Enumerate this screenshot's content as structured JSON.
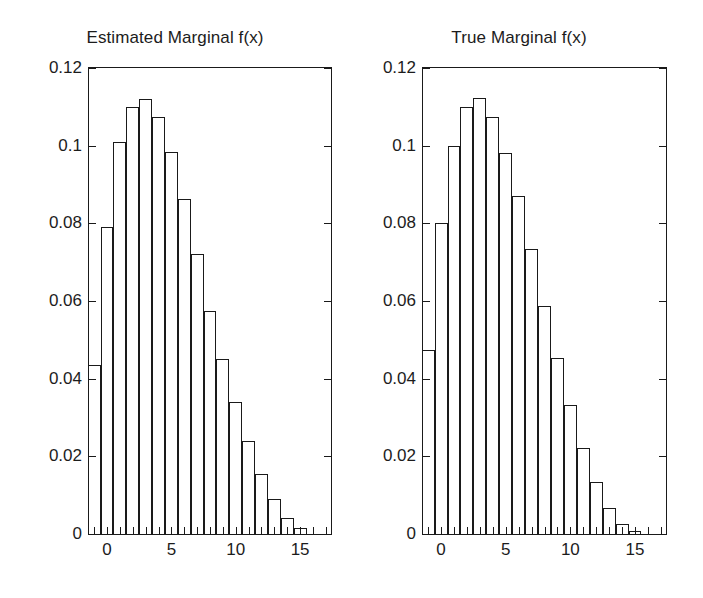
{
  "figure": {
    "background_color": "#ffffff",
    "line_color": "#1a1a1a",
    "text_color": "#1c1c1c"
  },
  "panels": [
    {
      "id": "estimated",
      "title": "Estimated Marginal f(x)"
    },
    {
      "id": "true",
      "title": "True Marginal f(x)"
    }
  ],
  "axis": {
    "y_tick_labels": [
      "0.12",
      "0.1",
      "0.08",
      "0.06",
      "0.04",
      "0.02",
      "0"
    ],
    "y_tick_values": [
      0.12,
      0.1,
      0.08,
      0.06,
      0.04,
      0.02,
      0
    ],
    "x_tick_labels": [
      "0",
      "5",
      "10",
      "15"
    ],
    "x_tick_values": [
      0,
      5,
      10,
      15
    ],
    "x_minor_step": 1,
    "ylim": [
      0,
      0.12
    ],
    "xlim": [
      -1.4,
      17.4
    ]
  },
  "chart_data": [
    {
      "type": "bar",
      "id": "estimated-marginal",
      "title": "Estimated Marginal f(x)",
      "xlabel": "",
      "ylabel": "",
      "xlim": [
        -1.4,
        17.4
      ],
      "ylim": [
        0,
        0.12
      ],
      "grid": false,
      "legend": "none",
      "bar_width": 1,
      "categories": [
        -1,
        0,
        1,
        2,
        3,
        4,
        5,
        6,
        7,
        8,
        9,
        10,
        11,
        12,
        13,
        14,
        15,
        16
      ],
      "values": [
        0.0435,
        0.079,
        0.101,
        0.11,
        0.112,
        0.1073,
        0.0985,
        0.0862,
        0.072,
        0.0575,
        0.045,
        0.034,
        0.024,
        0.0155,
        0.009,
        0.004,
        0.0015,
        0.0
      ],
      "y_tick_labels": [
        "0.12",
        "0.1",
        "0.08",
        "0.06",
        "0.04",
        "0.02",
        "0"
      ],
      "x_tick_labels": [
        "0",
        "5",
        "10",
        "15"
      ]
    },
    {
      "type": "bar",
      "id": "true-marginal",
      "title": "True Marginal f(x)",
      "xlabel": "",
      "ylabel": "",
      "xlim": [
        -1.4,
        17.4
      ],
      "ylim": [
        0,
        0.12
      ],
      "grid": false,
      "legend": "none",
      "bar_width": 1,
      "categories": [
        -1,
        0,
        1,
        2,
        3,
        4,
        5,
        6,
        7,
        8,
        9,
        10,
        11,
        12,
        13,
        14,
        15,
        16
      ],
      "values": [
        0.0475,
        0.08,
        0.1,
        0.11,
        0.1122,
        0.1073,
        0.0982,
        0.087,
        0.0733,
        0.0588,
        0.0452,
        0.0332,
        0.0222,
        0.0134,
        0.0066,
        0.0025,
        0.0008,
        0.0
      ],
      "y_tick_labels": [
        "0.12",
        "0.1",
        "0.08",
        "0.06",
        "0.04",
        "0.02",
        "0"
      ],
      "x_tick_labels": [
        "0",
        "5",
        "10",
        "15"
      ]
    }
  ]
}
